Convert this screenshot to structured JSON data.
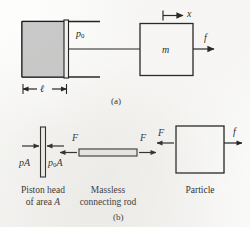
{
  "figure": {
    "panels": [
      {
        "id": "a",
        "caption": "(a)",
        "name": "piston-cylinder-system",
        "labels": {
          "gas_pressure": "p",
          "gas_pressure_sub": "0",
          "length": "ℓ",
          "mass": "m",
          "force": "f",
          "displacement": "x"
        }
      },
      {
        "id": "b",
        "caption": "(b)",
        "name": "free-body-diagrams",
        "bodies": [
          {
            "name": "piston-head",
            "caption_line1": "Piston head",
            "caption_line2_pre": "of area ",
            "caption_line2_sym": "A",
            "left_force": "pA",
            "right_force_pre": "p",
            "right_force_sub": "0",
            "right_force_post": "A"
          },
          {
            "name": "connecting-rod",
            "caption_line1": "Massless",
            "caption_line2": "connecting rod",
            "left_force": "F",
            "right_force": "F"
          },
          {
            "name": "particle",
            "caption_line1": "Particle",
            "left_force": "F",
            "right_force": "f"
          }
        ]
      }
    ],
    "colors": {
      "ink": "#1a1a1a",
      "piston_fill": "#c9c9c9",
      "rod_fill": "#f2f2f0",
      "paper": "#fdfdfc"
    }
  }
}
